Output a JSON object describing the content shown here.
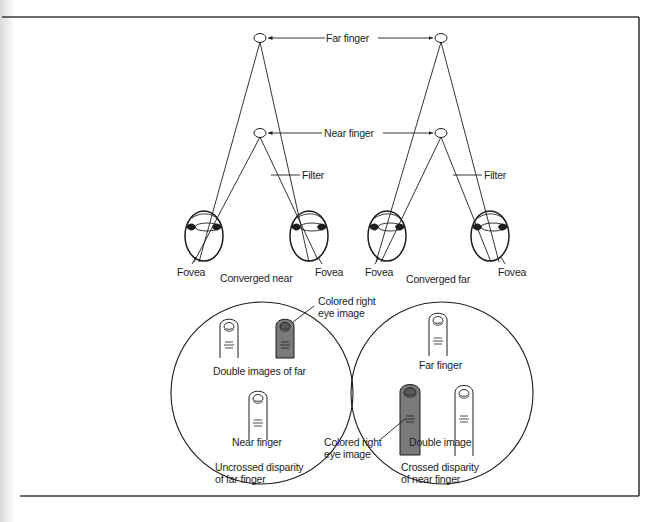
{
  "figure": {
    "top_labels": {
      "far_finger": "Far finger",
      "near_finger": "Near finger",
      "filter_left": "Filter",
      "filter_right": "Filter"
    },
    "eye_labels": {
      "fovea_1": "Fovea",
      "fovea_2": "Fovea",
      "fovea_3": "Fovea",
      "fovea_4": "Fovea",
      "converged_near": "Converged near",
      "converged_far": "Converged far"
    },
    "left_view": {
      "colored_label_line1": "Colored right",
      "colored_label_line2": "eye image",
      "double_images_label": "Double images of far",
      "near_finger_label": "Near finger",
      "caption_line1": "Uncrossed disparity",
      "caption_line2": "of far finger"
    },
    "right_view": {
      "far_finger_label": "Far finger",
      "double_image_label": "Double image",
      "colored_label_line1": "Colored right",
      "colored_label_line2": "eye image",
      "caption_line1": "Crossed disparity",
      "caption_line2": "of near finger"
    },
    "colors": {
      "ink": "#1e1e1e",
      "colored_finger": "#7a7a7a",
      "background": "#ffffff"
    }
  }
}
